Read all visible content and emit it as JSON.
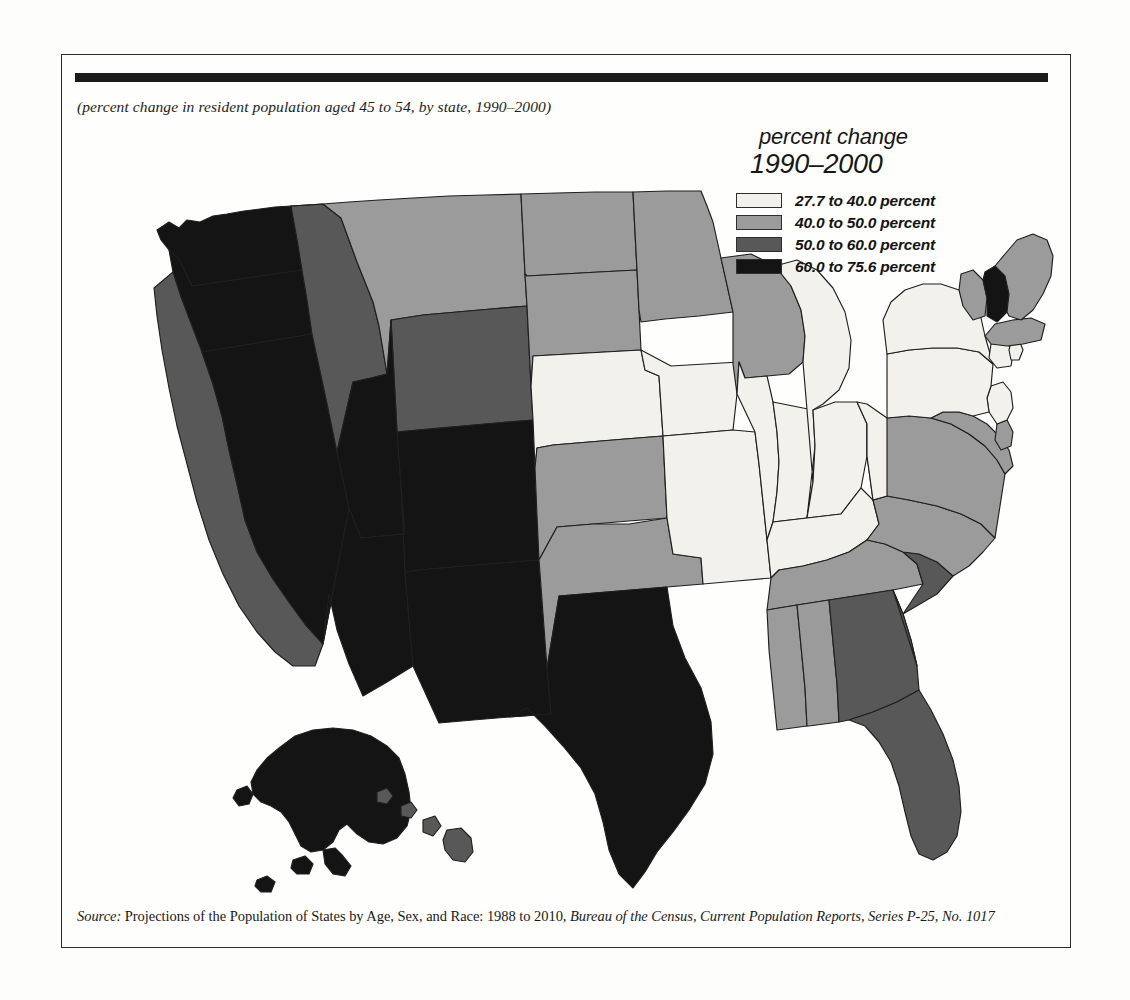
{
  "caption": "(percent change in resident population aged 45 to 54, by state, 1990–2000)",
  "legend": {
    "title_line1": "percent change",
    "title_line2": "1990–2000",
    "classes": [
      {
        "label": "27.7 to 40.0 percent",
        "color": "#f2f1ec",
        "min": 27.7,
        "max": 40.0
      },
      {
        "label": "40.0 to 50.0 percent",
        "color": "#9b9b9b",
        "min": 40.0,
        "max": 50.0
      },
      {
        "label": "50.0 to 60.0 percent",
        "color": "#585858",
        "min": 50.0,
        "max": 60.0
      },
      {
        "label": "60.0 to 75.6 percent",
        "color": "#141414",
        "min": 60.0,
        "max": 75.6
      }
    ]
  },
  "source": {
    "label": "Source:",
    "text_1": " Projections of the Population of States by Age, Sex, and Race: 1988 to 2010, ",
    "text_2": "Bureau of the Census, Current Population Reports, Series P-25, No. 1017"
  },
  "chart_data": {
    "type": "map",
    "map_kind": "choropleth",
    "region": "United States",
    "title": "percent change 1990–2000",
    "subtitle": "(percent change in resident population aged 45 to 54, by state, 1990–2000)",
    "value_label": "percent change in resident population aged 45 to 54",
    "value_range": [
      27.7,
      75.6
    ],
    "legend_position": "top-right",
    "class_breaks": [
      27.7,
      40.0,
      50.0,
      60.0,
      75.6
    ],
    "class_colors": [
      "#f2f1ec",
      "#9b9b9b",
      "#585858",
      "#141414"
    ],
    "class_labels": [
      "27.7 to 40.0 percent",
      "40.0 to 50.0 percent",
      "50.0 to 60.0 percent",
      "60.0 to 75.6 percent"
    ],
    "states": [
      {
        "code": "AL",
        "name": "Alabama",
        "class": 1
      },
      {
        "code": "AK",
        "name": "Alaska",
        "class": 3
      },
      {
        "code": "AZ",
        "name": "Arizona",
        "class": 3
      },
      {
        "code": "AR",
        "name": "Arkansas",
        "class": 1
      },
      {
        "code": "CA",
        "name": "California",
        "class": 2
      },
      {
        "code": "CO",
        "name": "Colorado",
        "class": 3
      },
      {
        "code": "CT",
        "name": "Connecticut",
        "class": 0
      },
      {
        "code": "DE",
        "name": "Delaware",
        "class": 1
      },
      {
        "code": "FL",
        "name": "Florida",
        "class": 2
      },
      {
        "code": "GA",
        "name": "Georgia",
        "class": 2
      },
      {
        "code": "HI",
        "name": "Hawaii",
        "class": 2
      },
      {
        "code": "ID",
        "name": "Idaho",
        "class": 2
      },
      {
        "code": "IL",
        "name": "Illinois",
        "class": 0
      },
      {
        "code": "IN",
        "name": "Indiana",
        "class": 0
      },
      {
        "code": "IA",
        "name": "Iowa",
        "class": 0
      },
      {
        "code": "KS",
        "name": "Kansas",
        "class": 1
      },
      {
        "code": "KY",
        "name": "Kentucky",
        "class": 0
      },
      {
        "code": "LA",
        "name": "Louisiana",
        "class": 1
      },
      {
        "code": "ME",
        "name": "Maine",
        "class": 1
      },
      {
        "code": "MD",
        "name": "Maryland",
        "class": 1
      },
      {
        "code": "MA",
        "name": "Massachusetts",
        "class": 1
      },
      {
        "code": "MI",
        "name": "Michigan",
        "class": 0
      },
      {
        "code": "MN",
        "name": "Minnesota",
        "class": 1
      },
      {
        "code": "MS",
        "name": "Mississippi",
        "class": 1
      },
      {
        "code": "MO",
        "name": "Missouri",
        "class": 0
      },
      {
        "code": "MT",
        "name": "Montana",
        "class": 1
      },
      {
        "code": "NE",
        "name": "Nebraska",
        "class": 0
      },
      {
        "code": "NV",
        "name": "Nevada",
        "class": 3
      },
      {
        "code": "NH",
        "name": "New Hampshire",
        "class": 3
      },
      {
        "code": "NJ",
        "name": "New Jersey",
        "class": 0
      },
      {
        "code": "NM",
        "name": "New Mexico",
        "class": 3
      },
      {
        "code": "NY",
        "name": "New York",
        "class": 0
      },
      {
        "code": "NC",
        "name": "North Carolina",
        "class": 1
      },
      {
        "code": "ND",
        "name": "North Dakota",
        "class": 1
      },
      {
        "code": "OH",
        "name": "Ohio",
        "class": 0
      },
      {
        "code": "OK",
        "name": "Oklahoma",
        "class": 1
      },
      {
        "code": "OR",
        "name": "Oregon",
        "class": 3
      },
      {
        "code": "PA",
        "name": "Pennsylvania",
        "class": 0
      },
      {
        "code": "RI",
        "name": "Rhode Island",
        "class": 0
      },
      {
        "code": "SC",
        "name": "South Carolina",
        "class": 2
      },
      {
        "code": "SD",
        "name": "South Dakota",
        "class": 1
      },
      {
        "code": "TN",
        "name": "Tennessee",
        "class": 1
      },
      {
        "code": "TX",
        "name": "Texas",
        "class": 3
      },
      {
        "code": "UT",
        "name": "Utah",
        "class": 3
      },
      {
        "code": "VT",
        "name": "Vermont",
        "class": 1
      },
      {
        "code": "VA",
        "name": "Virginia",
        "class": 1
      },
      {
        "code": "WA",
        "name": "Washington",
        "class": 3
      },
      {
        "code": "WV",
        "name": "West Virginia",
        "class": 0
      },
      {
        "code": "WI",
        "name": "Wisconsin",
        "class": 1
      },
      {
        "code": "WY",
        "name": "Wyoming",
        "class": 2
      }
    ]
  }
}
